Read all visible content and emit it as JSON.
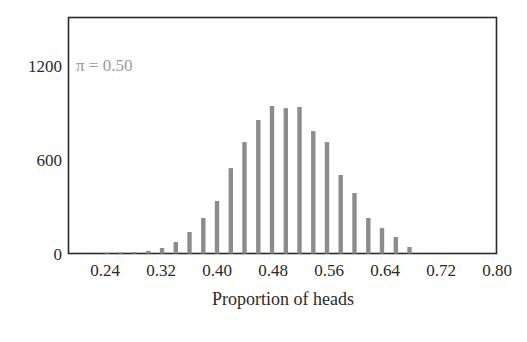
{
  "chart_data": {
    "type": "bar",
    "title": "",
    "annotation": "π = 0.50",
    "xlabel": "Proportion of heads",
    "ylabel": "",
    "xlim": [
      0.18,
      0.8
    ],
    "ylim": [
      0,
      1500
    ],
    "x_ticks": [
      "0.24",
      "0.32",
      "0.40",
      "0.48",
      "0.56",
      "0.64",
      "0.72",
      "0.80"
    ],
    "y_ticks": [
      "0",
      "600",
      "1200"
    ],
    "grid": false,
    "legend": null,
    "categories": [
      0.24,
      0.26,
      0.28,
      0.3,
      0.32,
      0.34,
      0.36,
      0.38,
      0.4,
      0.42,
      0.44,
      0.46,
      0.48,
      0.5,
      0.52,
      0.54,
      0.56,
      0.58,
      0.6,
      0.62,
      0.64,
      0.66,
      0.68
    ],
    "values": [
      5,
      7,
      10,
      17,
      36,
      74,
      138,
      227,
      336,
      546,
      712,
      853,
      942,
      929,
      936,
      782,
      712,
      502,
      387,
      227,
      163,
      106,
      42
    ],
    "colors": {
      "bar": "#8c8c8c",
      "axis": "#2a2a2a",
      "annotation": "#9a9a9a"
    }
  }
}
